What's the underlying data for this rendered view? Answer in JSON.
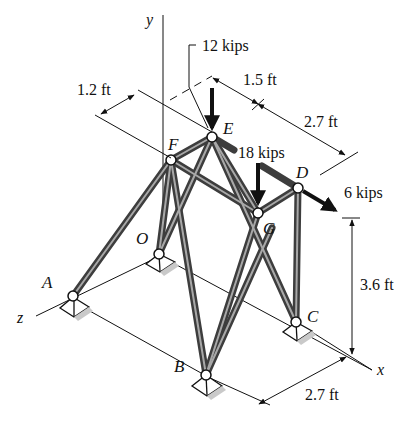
{
  "figure": {
    "type": "space-truss",
    "colors": {
      "member": "#4a4a4a",
      "member_highlight": "#9a9a9a",
      "line": "#111111",
      "support_fill": "#ffffff",
      "shadow": "#bdbdbd"
    }
  },
  "axes": {
    "x": "x",
    "y": "y",
    "z": "z"
  },
  "nodes": {
    "A": "A",
    "B": "B",
    "C": "C",
    "D": "D",
    "E": "E",
    "F": "F",
    "G": "G",
    "O": "O"
  },
  "loads": {
    "at_E": "12 kips",
    "at_G": "18 kips",
    "at_D": "6 kips"
  },
  "dimensions": {
    "offset_F": "1.2 ft",
    "top_E": "1.5 ft",
    "top_D": "2.7 ft",
    "height": "3.6 ft",
    "base": "2.7 ft"
  }
}
